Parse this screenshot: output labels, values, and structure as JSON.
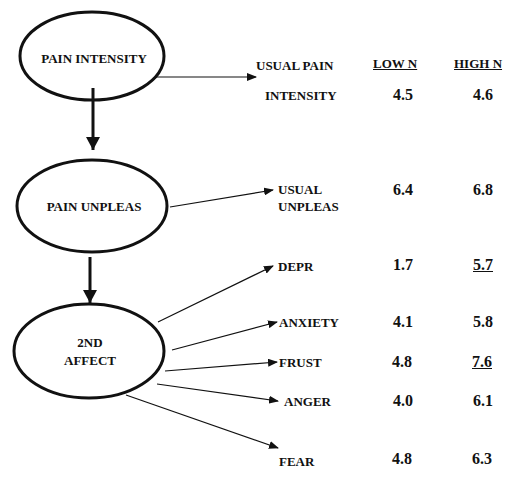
{
  "nodes": [
    {
      "id": "pain_intensity",
      "label": "PAIN INTENSITY"
    },
    {
      "id": "pain_unpleas",
      "label": "PAIN UNPLEAS"
    },
    {
      "id": "second_affect",
      "label_line1": "2ND",
      "label_line2": "AFFECT"
    }
  ],
  "table": {
    "headers": {
      "low": "LOW N",
      "high": "HIGH N"
    },
    "rows": [
      {
        "label_line1": "USUAL PAIN",
        "label_line2": "INTENSITY",
        "low": "4.5",
        "high": "4.6",
        "high_underlined": false
      },
      {
        "label_line1": "USUAL",
        "label_line2": "UNPLEAS",
        "low": "6.4",
        "high": "6.8",
        "high_underlined": false
      },
      {
        "label": "DEPR",
        "low": "1.7",
        "high": "5.7",
        "high_underlined": true
      },
      {
        "label": "ANXIETY",
        "low": "4.1",
        "high": "5.8",
        "high_underlined": false
      },
      {
        "label": "FRUST",
        "low": "4.8",
        "high": "7.6",
        "high_underlined": true
      },
      {
        "label": "ANGER",
        "low": "4.0",
        "high": "6.1",
        "high_underlined": false
      },
      {
        "label": "FEAR",
        "low": "4.8",
        "high": "6.3",
        "high_underlined": false
      }
    ]
  },
  "edges": [
    {
      "from": "PAIN INTENSITY",
      "to": "PAIN UNPLEAS",
      "style": "thick"
    },
    {
      "from": "PAIN UNPLEAS",
      "to": "2ND AFFECT",
      "style": "thick"
    },
    {
      "from": "PAIN INTENSITY",
      "to": "USUAL PAIN INTENSITY",
      "style": "thin"
    },
    {
      "from": "PAIN UNPLEAS",
      "to": "USUAL UNPLEAS",
      "style": "thin"
    },
    {
      "from": "2ND AFFECT",
      "to": "DEPR",
      "style": "thin"
    },
    {
      "from": "2ND AFFECT",
      "to": "ANXIETY",
      "style": "thin"
    },
    {
      "from": "2ND AFFECT",
      "to": "FRUST",
      "style": "thin"
    },
    {
      "from": "2ND AFFECT",
      "to": "ANGER",
      "style": "thin"
    },
    {
      "from": "2ND AFFECT",
      "to": "FEAR",
      "style": "thin"
    }
  ],
  "colors": {
    "ink": "#111111",
    "background": "#ffffff"
  }
}
